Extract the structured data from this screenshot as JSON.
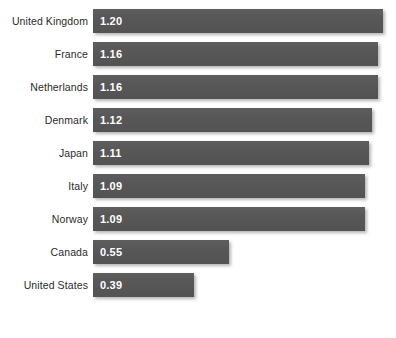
{
  "chart_data": {
    "type": "bar",
    "orientation": "horizontal",
    "title": "",
    "subtitle": "",
    "xlabel": "",
    "ylabel": "",
    "grid": false,
    "legend": null,
    "axis_visible": false,
    "tick_labels": [],
    "categories": [
      "United Kingdom",
      "France",
      "Netherlands",
      "Denmark",
      "Japan",
      "Italy",
      "Norway",
      "Canada",
      "United States"
    ],
    "values": [
      1.2,
      1.16,
      1.16,
      1.12,
      1.11,
      1.09,
      1.09,
      0.55,
      0.39
    ],
    "value_labels": [
      "1.20",
      "1.16",
      "1.16",
      "1.12",
      "1.11",
      "1.09",
      "1.09",
      "0.55",
      "0.39"
    ],
    "bar_pixel_widths": [
      290,
      285,
      285,
      279,
      276,
      272,
      272,
      136,
      101
    ],
    "xlim": [
      0,
      1.2
    ],
    "bar_color": "#575757",
    "value_label_color": "#ffffff",
    "category_label_color": "#2b2b2b",
    "background_color": "#ffffff"
  }
}
